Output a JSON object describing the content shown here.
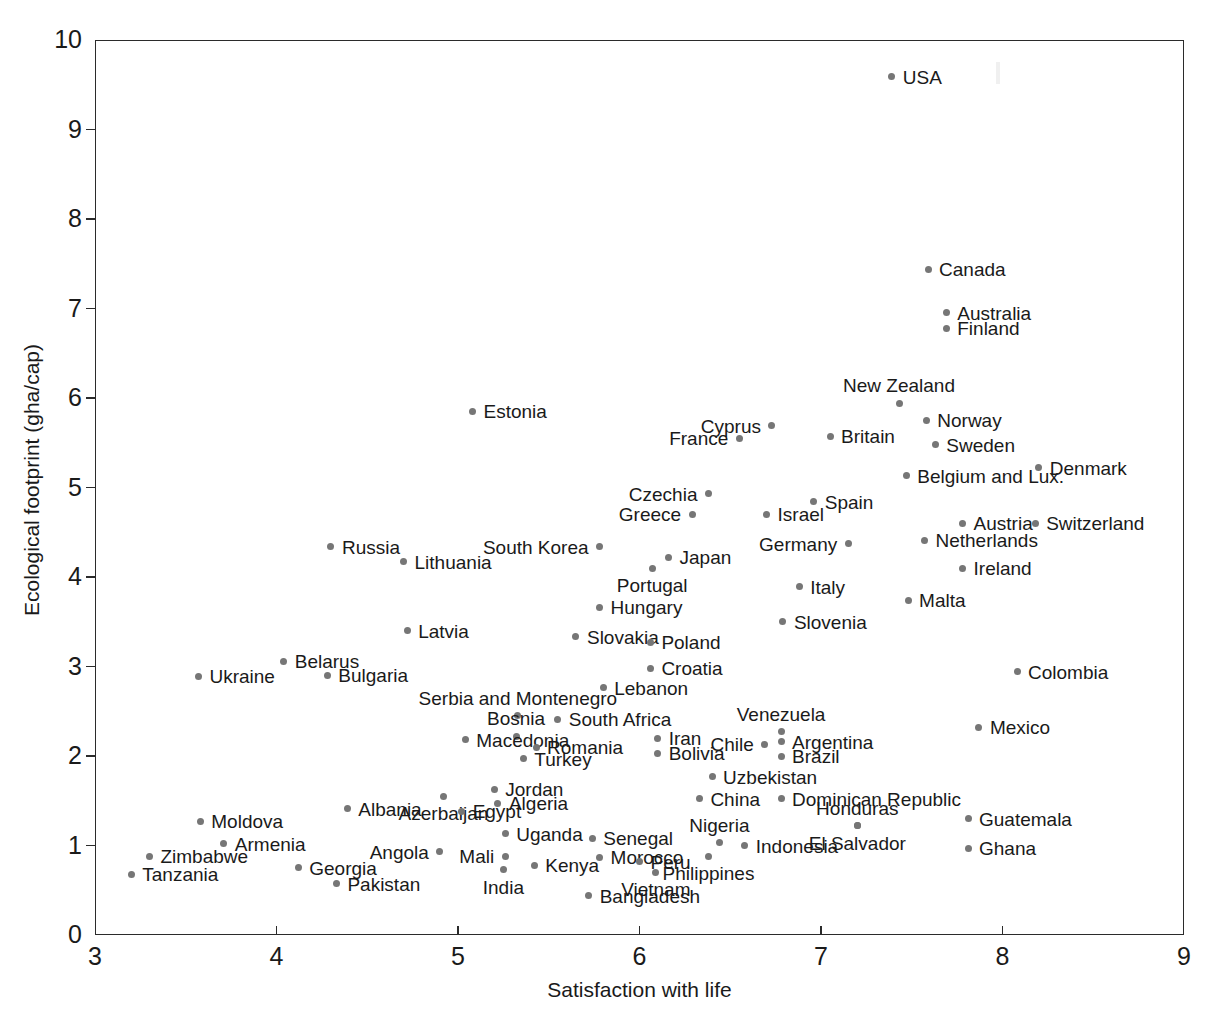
{
  "chart_data": {
    "type": "scatter",
    "title": "",
    "xlabel": "Satisfaction with life",
    "ylabel": "Ecological footprint (gha/cap)",
    "xlim": [
      3,
      9
    ],
    "ylim": [
      0,
      10
    ],
    "xticks": [
      "3",
      "4",
      "5",
      "6",
      "7",
      "8",
      "9"
    ],
    "yticks": [
      "0",
      "1",
      "2",
      "3",
      "4",
      "5",
      "6",
      "7",
      "8",
      "9",
      "10"
    ],
    "grid": false,
    "legend": "none",
    "marker_color": "#767676",
    "axis_color": "#2b2b2b",
    "points": [
      {
        "label": "USA",
        "x": 7.39,
        "y": 9.59,
        "pos": "right"
      },
      {
        "label": "Canada",
        "x": 7.59,
        "y": 7.44,
        "pos": "right"
      },
      {
        "label": "Australia",
        "x": 7.69,
        "y": 6.95,
        "pos": "right"
      },
      {
        "label": "Finland",
        "x": 7.69,
        "y": 6.78,
        "pos": "right"
      },
      {
        "label": "New Zealand",
        "x": 7.43,
        "y": 5.94,
        "pos": "above"
      },
      {
        "label": "Estonia",
        "x": 5.08,
        "y": 5.85,
        "pos": "right"
      },
      {
        "label": "Norway",
        "x": 7.58,
        "y": 5.75,
        "pos": "right"
      },
      {
        "label": "Cyprus",
        "x": 6.73,
        "y": 5.69,
        "pos": "left"
      },
      {
        "label": "Britain",
        "x": 7.05,
        "y": 5.57,
        "pos": "right"
      },
      {
        "label": "France",
        "x": 6.55,
        "y": 5.55,
        "pos": "left"
      },
      {
        "label": "Sweden",
        "x": 7.63,
        "y": 5.48,
        "pos": "right"
      },
      {
        "label": "Denmark",
        "x": 8.2,
        "y": 5.22,
        "pos": "right"
      },
      {
        "label": "Belgium and Lux.",
        "x": 7.47,
        "y": 5.13,
        "pos": "right"
      },
      {
        "label": "Czechia",
        "x": 6.38,
        "y": 4.93,
        "pos": "left"
      },
      {
        "label": "Spain",
        "x": 6.96,
        "y": 4.84,
        "pos": "right"
      },
      {
        "label": "Greece",
        "x": 6.29,
        "y": 4.7,
        "pos": "left"
      },
      {
        "label": "Israel",
        "x": 6.7,
        "y": 4.7,
        "pos": "right"
      },
      {
        "label": "Austria",
        "x": 7.78,
        "y": 4.6,
        "pos": "right"
      },
      {
        "label": "Switzerland",
        "x": 8.18,
        "y": 4.6,
        "pos": "right"
      },
      {
        "label": "Russia",
        "x": 4.3,
        "y": 4.34,
        "pos": "right"
      },
      {
        "label": "Netherlands",
        "x": 7.57,
        "y": 4.41,
        "pos": "right"
      },
      {
        "label": "Germany",
        "x": 7.15,
        "y": 4.37,
        "pos": "left"
      },
      {
        "label": "South Korea",
        "x": 5.78,
        "y": 4.34,
        "pos": "left"
      },
      {
        "label": "Japan",
        "x": 6.16,
        "y": 4.22,
        "pos": "right"
      },
      {
        "label": "Lithuania",
        "x": 4.7,
        "y": 4.17,
        "pos": "right"
      },
      {
        "label": "Portugal",
        "x": 6.07,
        "y": 4.1,
        "pos": "below"
      },
      {
        "label": "Ireland",
        "x": 7.78,
        "y": 4.1,
        "pos": "right"
      },
      {
        "label": "Italy",
        "x": 6.88,
        "y": 3.89,
        "pos": "right"
      },
      {
        "label": "Malta",
        "x": 7.48,
        "y": 3.74,
        "pos": "right"
      },
      {
        "label": "Hungary",
        "x": 5.78,
        "y": 3.66,
        "pos": "right"
      },
      {
        "label": "Slovenia",
        "x": 6.79,
        "y": 3.5,
        "pos": "right"
      },
      {
        "label": "Latvia",
        "x": 4.72,
        "y": 3.4,
        "pos": "right"
      },
      {
        "label": "Slovakia",
        "x": 5.65,
        "y": 3.33,
        "pos": "right"
      },
      {
        "label": "Poland",
        "x": 6.06,
        "y": 3.27,
        "pos": "right"
      },
      {
        "label": "Belarus",
        "x": 4.04,
        "y": 3.06,
        "pos": "right"
      },
      {
        "label": "Croatia",
        "x": 6.06,
        "y": 2.98,
        "pos": "right"
      },
      {
        "label": "Colombia",
        "x": 8.08,
        "y": 2.94,
        "pos": "right"
      },
      {
        "label": "Bulgaria",
        "x": 4.28,
        "y": 2.9,
        "pos": "right"
      },
      {
        "label": "Ukraine",
        "x": 3.57,
        "y": 2.89,
        "pos": "right"
      },
      {
        "label": "Lebanon",
        "x": 5.8,
        "y": 2.76,
        "pos": "right"
      },
      {
        "label": "Serbia and Montenegro",
        "x": 5.33,
        "y": 2.45,
        "pos": "above"
      },
      {
        "label": "South Africa",
        "x": 5.55,
        "y": 2.41,
        "pos": "right"
      },
      {
        "label": "Mexico",
        "x": 7.87,
        "y": 2.32,
        "pos": "right"
      },
      {
        "label": "Venezuela",
        "x": 6.78,
        "y": 2.27,
        "pos": "above"
      },
      {
        "label": "Bosnia",
        "x": 5.32,
        "y": 2.22,
        "pos": "above"
      },
      {
        "label": "Iran",
        "x": 6.1,
        "y": 2.2,
        "pos": "right"
      },
      {
        "label": "Argentina",
        "x": 6.78,
        "y": 2.16,
        "pos": "right"
      },
      {
        "label": "Macedonia",
        "x": 5.04,
        "y": 2.18,
        "pos": "right"
      },
      {
        "label": "Chile",
        "x": 6.69,
        "y": 2.13,
        "pos": "left"
      },
      {
        "label": "Romania",
        "x": 5.43,
        "y": 2.1,
        "pos": "right"
      },
      {
        "label": "Bolivia",
        "x": 6.1,
        "y": 2.03,
        "pos": "right"
      },
      {
        "label": "Brazil",
        "x": 6.78,
        "y": 2.0,
        "pos": "right"
      },
      {
        "label": "Turkey",
        "x": 5.36,
        "y": 1.97,
        "pos": "right"
      },
      {
        "label": "Uzbekistan",
        "x": 6.4,
        "y": 1.77,
        "pos": "right"
      },
      {
        "label": "Jordan",
        "x": 5.2,
        "y": 1.63,
        "pos": "right"
      },
      {
        "label": "Azerbaijan",
        "x": 4.92,
        "y": 1.55,
        "pos": "below"
      },
      {
        "label": "China",
        "x": 6.33,
        "y": 1.52,
        "pos": "right"
      },
      {
        "label": "Dominican Republic",
        "x": 6.78,
        "y": 1.52,
        "pos": "right"
      },
      {
        "label": "Algeria",
        "x": 5.22,
        "y": 1.47,
        "pos": "right"
      },
      {
        "label": "Albania",
        "x": 4.39,
        "y": 1.41,
        "pos": "right"
      },
      {
        "label": "Egypt",
        "x": 5.02,
        "y": 1.38,
        "pos": "right"
      },
      {
        "label": "Guatemala",
        "x": 7.81,
        "y": 1.3,
        "pos": "right"
      },
      {
        "label": "Moldova",
        "x": 3.58,
        "y": 1.27,
        "pos": "right"
      },
      {
        "label": "Honduras",
        "x": 7.2,
        "y": 1.22,
        "pos": "above"
      },
      {
        "label": "El Salvador",
        "x": 7.2,
        "y": 1.22,
        "pos": "below"
      },
      {
        "label": "Uganda",
        "x": 5.26,
        "y": 1.13,
        "pos": "right"
      },
      {
        "label": "Senegal",
        "x": 5.74,
        "y": 1.08,
        "pos": "right"
      },
      {
        "label": "Nigeria",
        "x": 6.44,
        "y": 1.03,
        "pos": "above"
      },
      {
        "label": "Armenia",
        "x": 3.71,
        "y": 1.02,
        "pos": "right"
      },
      {
        "label": "Indonesia",
        "x": 6.58,
        "y": 1.0,
        "pos": "right"
      },
      {
        "label": "Ghana",
        "x": 7.81,
        "y": 0.97,
        "pos": "right"
      },
      {
        "label": "Angola",
        "x": 4.9,
        "y": 0.93,
        "pos": "left"
      },
      {
        "label": "Zimbabwe",
        "x": 3.3,
        "y": 0.88,
        "pos": "right"
      },
      {
        "label": "Mali",
        "x": 5.26,
        "y": 0.88,
        "pos": "left"
      },
      {
        "label": "Morocco",
        "x": 5.78,
        "y": 0.87,
        "pos": "right"
      },
      {
        "label": "Philippines",
        "x": 6.38,
        "y": 0.88,
        "pos": "below"
      },
      {
        "label": "Peru",
        "x": 6.0,
        "y": 0.82,
        "pos": "right"
      },
      {
        "label": "Kenya",
        "x": 5.42,
        "y": 0.78,
        "pos": "right"
      },
      {
        "label": "Georgia",
        "x": 4.12,
        "y": 0.75,
        "pos": "right"
      },
      {
        "label": "India",
        "x": 5.25,
        "y": 0.73,
        "pos": "below"
      },
      {
        "label": "Vietnam",
        "x": 6.09,
        "y": 0.7,
        "pos": "below"
      },
      {
        "label": "Tanzania",
        "x": 3.2,
        "y": 0.68,
        "pos": "right"
      },
      {
        "label": "Pakistan",
        "x": 4.33,
        "y": 0.57,
        "pos": "right"
      },
      {
        "label": "Bangladesh",
        "x": 5.72,
        "y": 0.44,
        "pos": "right"
      }
    ]
  }
}
